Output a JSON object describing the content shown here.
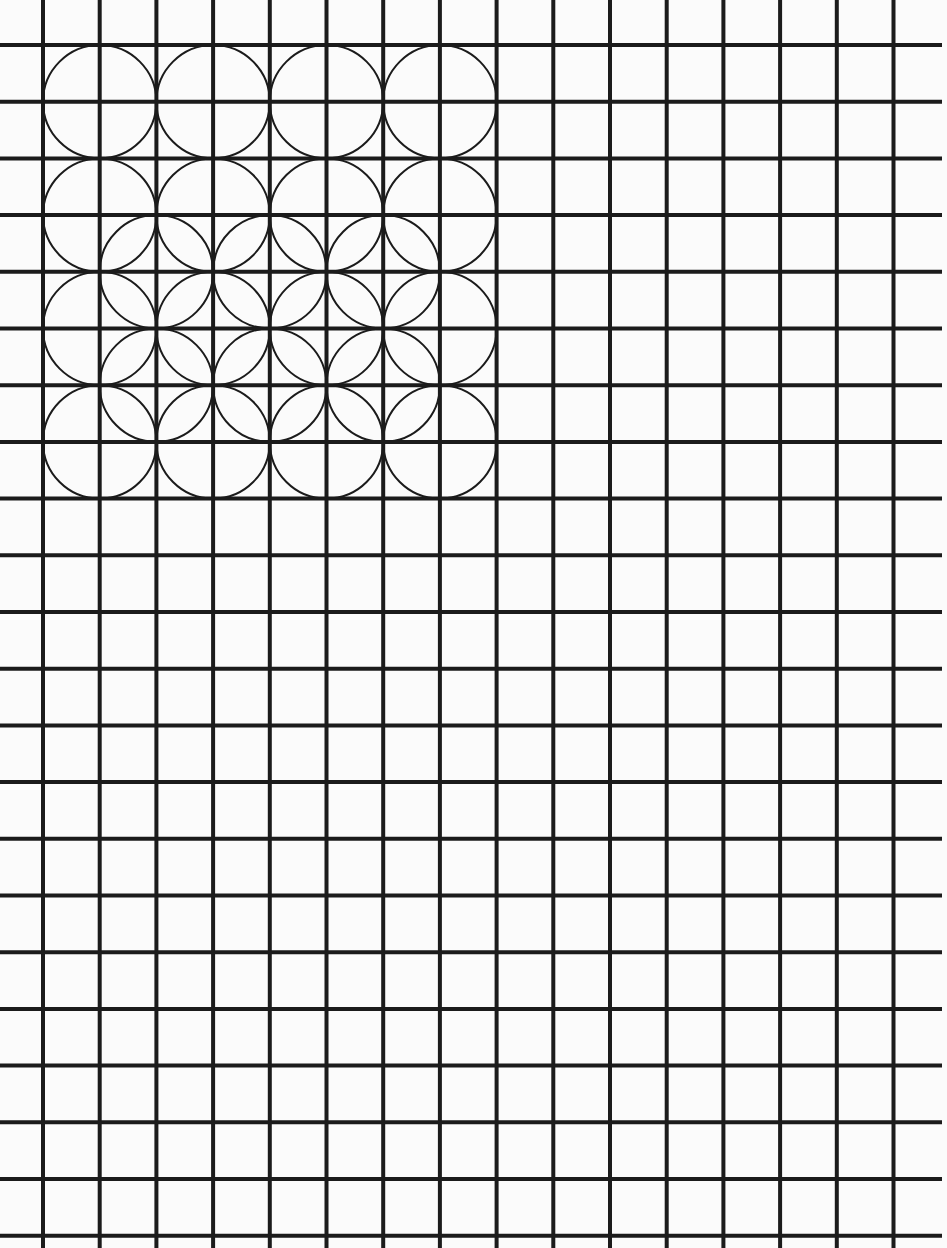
{
  "colors": {
    "background": "#fbfbfb",
    "grid_line": "#1b1b1b",
    "circle_line": "#1b1b1b"
  },
  "grid": {
    "columns": 15,
    "rows": 21,
    "vertical_lines": 16,
    "horizontal_lines": 22
  },
  "pattern": {
    "description": "4x4 array of circles with diameter of two grid cells, plus a 3x2 array of offset circles overlapping the middle rows",
    "circle_radius_cells": 1,
    "main_circle_centers_cells": [
      [
        1,
        1
      ],
      [
        3,
        1
      ],
      [
        5,
        1
      ],
      [
        7,
        1
      ],
      [
        1,
        3
      ],
      [
        3,
        3
      ],
      [
        5,
        3
      ],
      [
        7,
        3
      ],
      [
        1,
        5
      ],
      [
        3,
        5
      ],
      [
        5,
        5
      ],
      [
        7,
        5
      ],
      [
        1,
        7
      ],
      [
        3,
        7
      ],
      [
        5,
        7
      ],
      [
        7,
        7
      ]
    ],
    "offset_circle_centers_cells": [
      [
        2,
        4
      ],
      [
        4,
        4
      ],
      [
        6,
        4
      ],
      [
        2,
        6
      ],
      [
        4,
        6
      ],
      [
        6,
        6
      ]
    ]
  }
}
